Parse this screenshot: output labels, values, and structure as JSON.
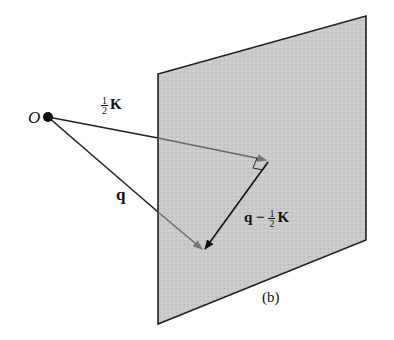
{
  "diagram": {
    "origin_label": "O",
    "half_k_label": {
      "num": "1",
      "den": "2",
      "vec": "K"
    },
    "q_label": "q",
    "q_minus_half_k_label": {
      "prefix": "q − ",
      "num": "1",
      "den": "2",
      "vec": "K"
    },
    "caption": "(b)",
    "plane_color": "#c8c8c8",
    "line_color": "#222222"
  }
}
